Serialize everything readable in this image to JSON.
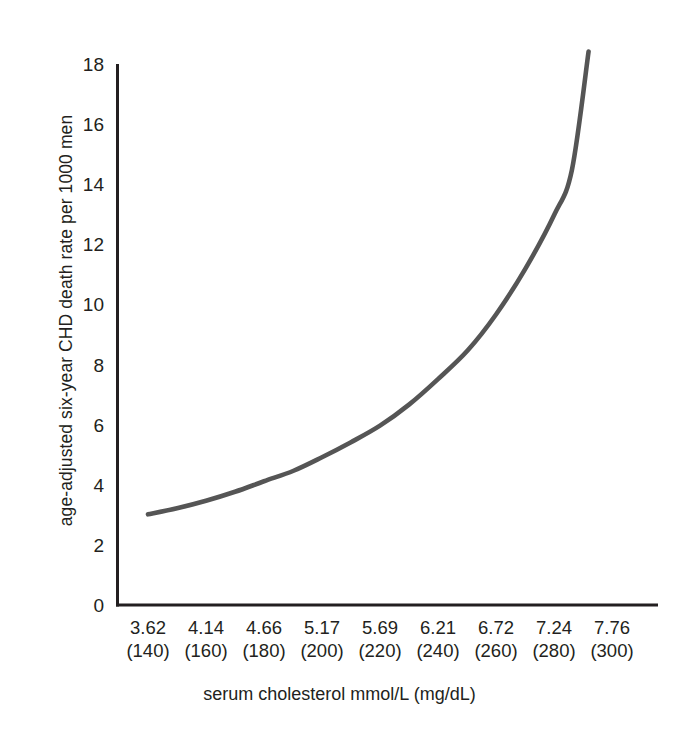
{
  "chart_data": {
    "type": "line",
    "title": "",
    "xlabel": "serum cholesterol mmol/L (mg/dL)",
    "ylabel": "age-adjusted six-year CHD death rate per 1000 men",
    "xlim": [
      3.62,
      7.76
    ],
    "ylim": [
      0,
      18
    ],
    "grid": false,
    "legend": null,
    "line_color": "#555555",
    "axis_color": "#231f20",
    "xticks": [
      3.62,
      4.14,
      4.66,
      5.17,
      5.69,
      6.21,
      6.72,
      7.24,
      7.76
    ],
    "xtick_labels": [
      "3.62",
      "4.14",
      "4.66",
      "5.17",
      "5.69",
      "6.21",
      "6.72",
      "7.24",
      "7.76"
    ],
    "xtick_labels_secondary": [
      "(140)",
      "(160)",
      "(180)",
      "(200)",
      "(220)",
      "(240)",
      "(260)",
      "(280)",
      "(300)"
    ],
    "yticks": [
      0,
      2,
      4,
      6,
      8,
      10,
      12,
      14,
      16,
      18
    ],
    "ytick_labels": [
      "0",
      "2",
      "4",
      "6",
      "8",
      "10",
      "12",
      "14",
      "16",
      "18"
    ],
    "series": [
      {
        "name": "CHD death rate",
        "x": [
          3.62,
          3.88,
          4.14,
          4.4,
          4.66,
          4.92,
          5.17,
          5.43,
          5.69,
          5.95,
          6.21,
          6.47,
          6.72,
          6.98,
          7.24,
          7.4,
          7.55
        ],
        "values": [
          3.05,
          3.25,
          3.5,
          3.8,
          4.15,
          4.5,
          4.95,
          5.45,
          6.0,
          6.7,
          7.55,
          8.5,
          9.7,
          11.2,
          13.0,
          14.5,
          18.45
        ]
      }
    ]
  },
  "axis_geometry": {
    "x_pixels": [
      148,
      206,
      264,
      322,
      380,
      438,
      496,
      554,
      612
    ],
    "y_zero_px": 606,
    "y_max_px": 65,
    "plot_left_px": 116,
    "plot_right_px": 658
  }
}
